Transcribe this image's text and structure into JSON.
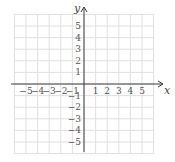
{
  "chart_data": {
    "type": "scatter",
    "title": "",
    "xlabel": "x",
    "ylabel": "y",
    "xlim": [
      -6,
      6
    ],
    "ylim": [
      -6,
      6
    ],
    "grid": true,
    "x_ticks": [
      "−5",
      "−4",
      "−3",
      "−2",
      "−1",
      "1",
      "2",
      "3",
      "4",
      "5"
    ],
    "y_ticks": [
      "5",
      "4",
      "3",
      "2",
      "1",
      "−1",
      "−2",
      "−3",
      "−4",
      "−5"
    ],
    "x_tick_values": [
      -5,
      -4,
      -3,
      -2,
      -1,
      1,
      2,
      3,
      4,
      5
    ],
    "y_tick_values": [
      5,
      4,
      3,
      2,
      1,
      -1,
      -2,
      -3,
      -4,
      -5
    ],
    "series": [],
    "legend": null
  },
  "colors": {
    "grid": "#e0e0e0",
    "axis": "#3c3c3c",
    "text": "#555555"
  }
}
